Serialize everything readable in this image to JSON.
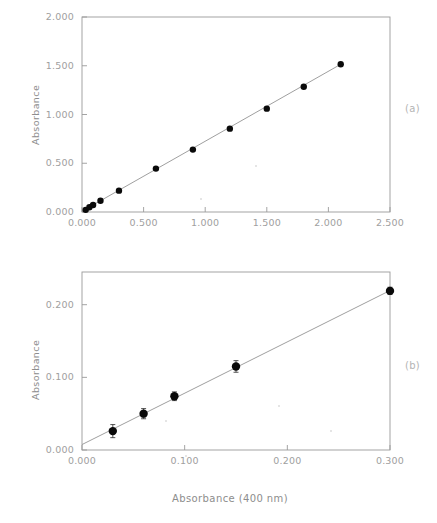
{
  "figure": {
    "panels": [
      {
        "id": "a",
        "label": "(a)"
      },
      {
        "id": "b",
        "label": "(b)"
      }
    ]
  },
  "panel_a": {
    "label": "(a)",
    "ylabel": "Absorbance",
    "xticks": [
      "0.000",
      "0.500",
      "1.000",
      "1.500",
      "2.000",
      "2.500"
    ],
    "yticks": [
      "0.000",
      "0.500",
      "1.000",
      "1.500",
      "2.000"
    ]
  },
  "panel_b": {
    "label": "(b)",
    "ylabel": "Absorbance",
    "xlabel": "Absorbance (400 nm)",
    "xticks": [
      "0.000",
      "0.100",
      "0.200",
      "0.300"
    ],
    "yticks": [
      "0.000",
      "0.100",
      "0.200"
    ]
  },
  "chart_data": [
    {
      "type": "scatter",
      "panel": "a",
      "title": "",
      "xlabel": "Absorbance (400 nm)",
      "ylabel": "Absorbance",
      "xlim": [
        0.0,
        2.5
      ],
      "ylim": [
        0.0,
        2.0
      ],
      "xticks": [
        0.0,
        0.5,
        1.0,
        1.5,
        2.0,
        2.5
      ],
      "yticks": [
        0.0,
        0.5,
        1.0,
        1.5,
        2.0
      ],
      "xticklabels": [
        "0.000",
        "0.500",
        "1.000",
        "1.500",
        "2.000",
        "2.500"
      ],
      "yticklabels": [
        "0.000",
        "0.500",
        "1.000",
        "1.500",
        "2.000"
      ],
      "grid": false,
      "legend": null,
      "series": [
        {
          "name": "calibration points",
          "marker": "filled-circle",
          "x": [
            0.03,
            0.06,
            0.09,
            0.15,
            0.3,
            0.6,
            0.9,
            1.2,
            1.5,
            1.8,
            2.1
          ],
          "y": [
            0.022,
            0.048,
            0.072,
            0.115,
            0.219,
            0.445,
            0.64,
            0.855,
            1.06,
            1.285,
            1.515
          ]
        },
        {
          "name": "linear fit",
          "type": "line",
          "x": [
            0.0,
            2.1
          ],
          "y": [
            0.008,
            1.515
          ]
        }
      ]
    },
    {
      "type": "scatter",
      "panel": "b",
      "title": "",
      "xlabel": "Absorbance (400 nm)",
      "ylabel": "Absorbance",
      "xlim": [
        0.0,
        0.3
      ],
      "ylim": [
        0.0,
        0.245
      ],
      "xticks": [
        0.0,
        0.1,
        0.2,
        0.3
      ],
      "yticks": [
        0.0,
        0.1,
        0.2
      ],
      "xticklabels": [
        "0.000",
        "0.100",
        "0.200",
        "0.300"
      ],
      "yticklabels": [
        "0.000",
        "0.100",
        "0.200"
      ],
      "grid": false,
      "legend": null,
      "series": [
        {
          "name": "calibration points (expanded)",
          "marker": "filled-circle",
          "errorbars": "yerr",
          "x": [
            0.03,
            0.06,
            0.09,
            0.15,
            0.3
          ],
          "y": [
            0.026,
            0.05,
            0.074,
            0.115,
            0.219
          ],
          "yerr": [
            0.009,
            0.007,
            0.006,
            0.008,
            0.005
          ]
        },
        {
          "name": "linear fit",
          "type": "line",
          "x": [
            0.0,
            0.3
          ],
          "y": [
            0.0075,
            0.2195
          ]
        }
      ]
    }
  ]
}
